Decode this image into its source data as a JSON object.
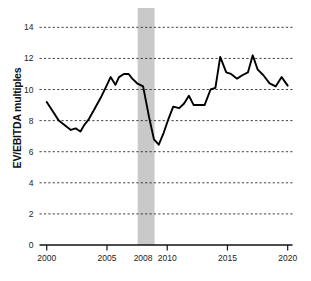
{
  "chart_data": {
    "type": "line",
    "title": "",
    "xlabel": "",
    "ylabel": "EV/EBITDA multiples",
    "xlim": [
      1999.4,
      2020.4
    ],
    "ylim": [
      0,
      14.6
    ],
    "grid": true,
    "grid_style": "dashed-horizontal",
    "legend": "none",
    "yticks": [
      0,
      2,
      4,
      6,
      8,
      10,
      12,
      14
    ],
    "ytick_labels": [
      "0",
      "2",
      "4",
      "6",
      "8",
      "10",
      "12",
      "14"
    ],
    "xticks": [
      2000,
      2005,
      2010,
      2015,
      2020
    ],
    "xtick_labels": [
      "2000",
      "2005",
      "2010",
      "2015",
      "2020"
    ],
    "extra_annotations": [
      {
        "name": "recession-band-label",
        "label": "2008",
        "x": 2008,
        "type": "x-axis-annotation"
      }
    ],
    "shaded_regions": [
      {
        "name": "recession-band",
        "x_start": 2007.55,
        "x_end": 2008.95,
        "color": "#c9c9c9",
        "label": "2008"
      }
    ],
    "series": [
      {
        "name": "EV/EBITDA multiple",
        "color": "#000000",
        "line_width": 1.9,
        "x": [
          2000.0,
          2000.5,
          2001.0,
          2001.5,
          2002.0,
          2002.4,
          2002.8,
          2003.1,
          2003.5,
          2004.0,
          2004.5,
          2005.0,
          2005.3,
          2005.7,
          2006.0,
          2006.4,
          2006.8,
          2007.1,
          2007.5,
          2008.0,
          2008.5,
          2008.9,
          2009.3,
          2009.7,
          2010.1,
          2010.5,
          2011.0,
          2011.4,
          2011.8,
          2012.2,
          2012.7,
          2013.1,
          2013.6,
          2014.0,
          2014.4,
          2014.9,
          2015.3,
          2015.8,
          2016.2,
          2016.7,
          2017.1,
          2017.5,
          2018.0,
          2018.5,
          2019.0,
          2019.5,
          2020.0
        ],
        "y": [
          9.2,
          8.6,
          8.0,
          7.7,
          7.4,
          7.5,
          7.3,
          7.7,
          8.1,
          8.8,
          9.5,
          10.3,
          10.8,
          10.3,
          10.8,
          11.0,
          11.0,
          10.7,
          10.4,
          10.2,
          8.2,
          6.8,
          6.45,
          7.2,
          8.1,
          8.9,
          8.8,
          9.1,
          9.6,
          9.0,
          9.0,
          9.0,
          10.0,
          10.1,
          12.1,
          11.1,
          11.0,
          10.7,
          10.9,
          11.1,
          12.2,
          11.3,
          10.9,
          10.4,
          10.2,
          10.8,
          10.25
        ]
      }
    ]
  },
  "axes": {
    "y_title": "EV/EBITDA multiples"
  }
}
